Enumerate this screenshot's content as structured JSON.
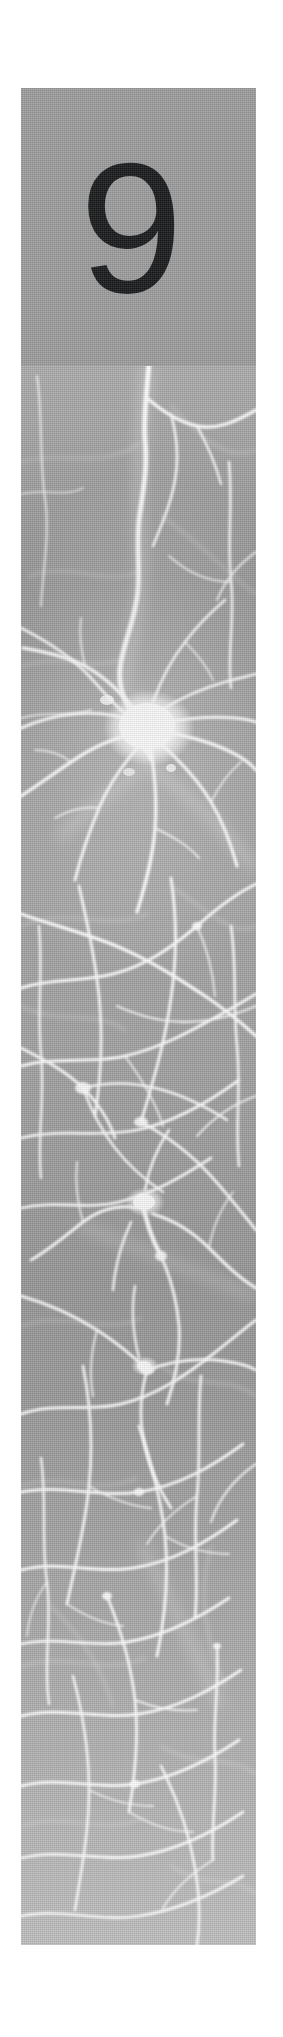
{
  "page": {
    "kind": "book-chapter-opening-page",
    "background_color": "#ffffff",
    "width": 283,
    "height": 2037
  },
  "number_block": {
    "chapter_number": "9",
    "background_color": "#9b9b9b",
    "number_color": "#17181a",
    "x": 21,
    "y": 88,
    "width": 235,
    "height": 278
  },
  "photo": {
    "caption": "",
    "alt": "fluorescence micrograph of a neuron network",
    "background_color": "#9d9d9d",
    "neurite_color": "#ffffff",
    "x": 21,
    "y": 366,
    "width": 235,
    "height": 1579
  }
}
